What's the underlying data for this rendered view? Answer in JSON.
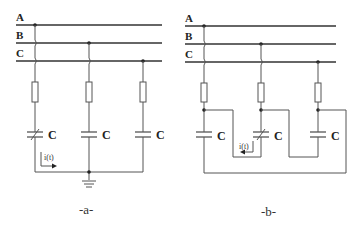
{
  "diagram": {
    "figure_a": {
      "caption": "-a-",
      "bus_labels": [
        "A",
        "B",
        "C"
      ],
      "capacitor_labels": [
        "C",
        "C",
        "C"
      ],
      "current_label": "i(t)",
      "description": "Three capacitors connected in star to phases A, B, C via fuses, star point grounded; capacitor on phase A is variable"
    },
    "figure_b": {
      "caption": "-b-",
      "bus_labels": [
        "A",
        "B",
        "C"
      ],
      "capacitor_labels": [
        "C",
        "C",
        "C"
      ],
      "current_label": "i(t)",
      "description": "Three capacitors connected in delta to phases A, B, C via fuses; capacitor on phase B is variable"
    },
    "colors": {
      "line": "#555555",
      "text": "#222222",
      "background": "#ffffff"
    }
  }
}
